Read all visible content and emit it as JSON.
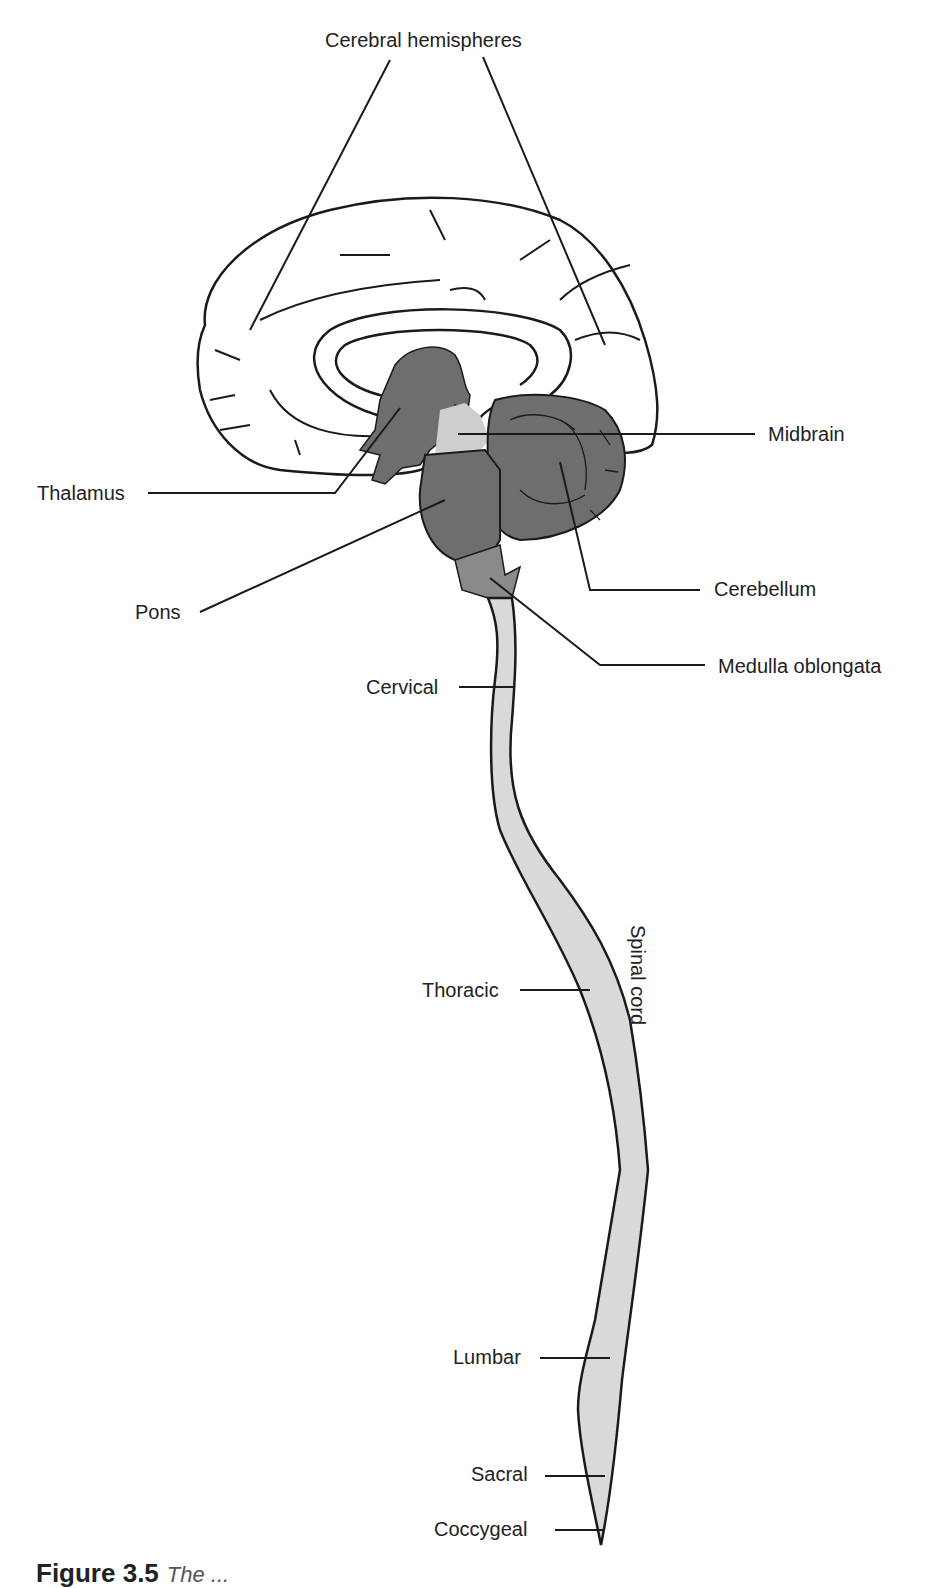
{
  "figure": {
    "caption_label": "Figure 3.5",
    "caption_text": "The ..."
  },
  "labels": {
    "cerebral_hemispheres": "Cerebral hemispheres",
    "midbrain": "Midbrain",
    "thalamus": "Thalamus",
    "cerebellum": "Cerebellum",
    "pons": "Pons",
    "medulla_oblongata": "Medulla oblongata",
    "cervical": "Cervical",
    "thoracic": "Thoracic",
    "spinal_cord": "Spinal cord",
    "lumbar": "Lumbar",
    "sacral": "Sacral",
    "coccygeal": "Coccygeal"
  },
  "colors": {
    "outline": "#1a1a1a",
    "brainstem_dark": "#6e6e6e",
    "midbrain_light": "#cfcfcf",
    "spinal_light": "#d9d9d9",
    "cerebrum_fill": "#ffffff"
  }
}
